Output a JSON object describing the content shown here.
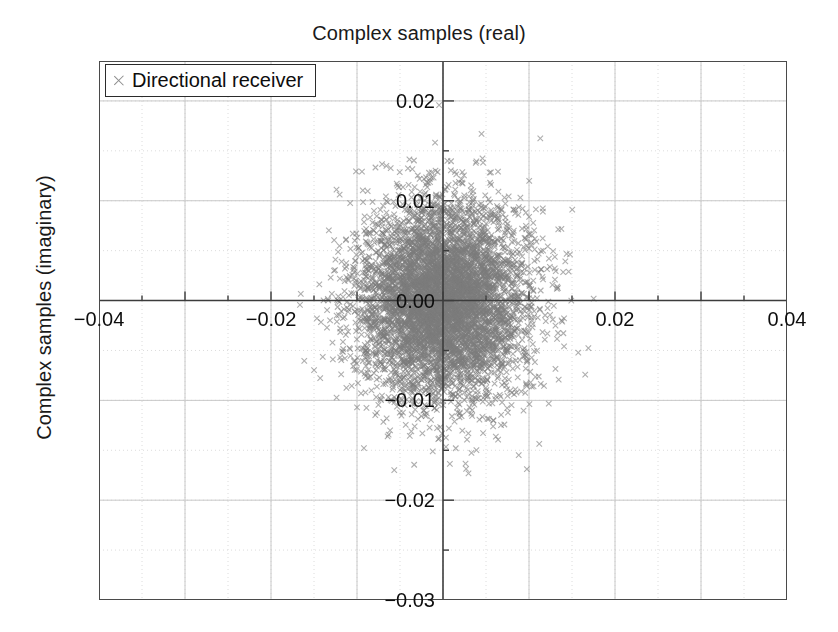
{
  "chart_data": {
    "type": "scatter",
    "title": "Complex samples (real)",
    "xlabel": "",
    "ylabel": "Complex samples (imaginary)",
    "xlim": [
      -0.04,
      0.04
    ],
    "ylim": [
      -0.03,
      0.024
    ],
    "xticks": [
      -0.04,
      -0.02,
      0.02,
      0.04
    ],
    "xtick_labels": [
      "-0.04",
      "-0.02",
      "0.02",
      "0.04"
    ],
    "yticks": [
      0.02,
      0.01,
      0.0,
      -0.01,
      -0.02,
      -0.03
    ],
    "ytick_labels": [
      "0.02",
      "0.01",
      "0.00",
      "-0.01",
      "-0.02",
      "-0.03"
    ],
    "xtick_minor_step": 0.005,
    "ytick_minor_step": 0.005,
    "grid": true,
    "grid_major_color": "#c8c8c8",
    "grid_minor_color": "#dcdcdc",
    "grid_minor_style": "dotted",
    "axis_spine_color": "#4a4a4a",
    "zero_axis_color": "#3c3c3c",
    "legend_position": "upper-left",
    "series": [
      {
        "name": "Directional receiver",
        "marker": "x",
        "marker_color": "#7d7d7d",
        "marker_size": 5.5,
        "n_points": 6000,
        "distribution": "gaussian-complex",
        "mean_real": 0.0,
        "mean_imag": 0.0,
        "sigma_real": 0.0048,
        "sigma_imag": 0.0048
      }
    ]
  },
  "legend": {
    "entries": [
      {
        "label": "Directional receiver",
        "marker": "x-marker"
      }
    ]
  },
  "axes": {
    "title": "Complex samples (real)",
    "ylabel": "Complex samples (imaginary)"
  }
}
